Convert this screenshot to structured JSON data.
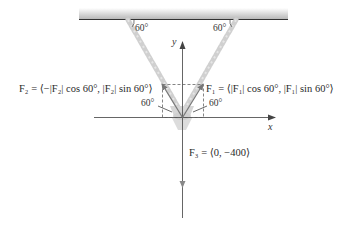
{
  "diagram": {
    "type": "force-equilibrium",
    "ceiling": {
      "angle_left": "60°",
      "angle_right": "60°"
    },
    "axes": {
      "x_label": "x",
      "y_label": "y"
    },
    "forces": {
      "F1": {
        "label": "F₁ = ⟨|F₁| cos 60°, |F₁| sin 60°⟩",
        "angle_label": "60°"
      },
      "F2": {
        "label": "F₂ = ⟨−|F₂| cos 60°, |F₂| sin 60°⟩",
        "angle_label": "60°"
      },
      "F3": {
        "label": "F₃ = ⟨0, −400⟩"
      }
    },
    "colors": {
      "chain": "#c8c8c8",
      "vector": "#6e6e6e",
      "axis": "#555555",
      "ceiling_line": "#333333"
    }
  }
}
